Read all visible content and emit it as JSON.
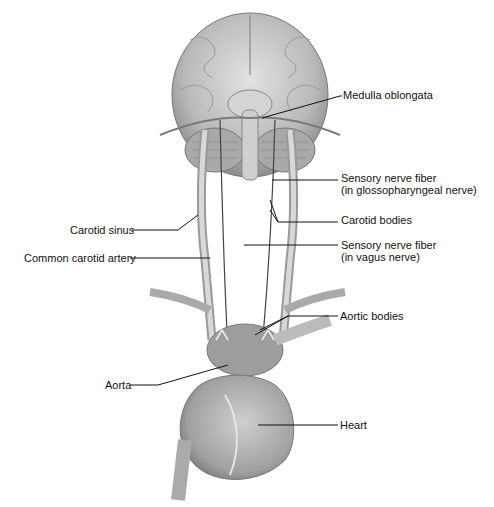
{
  "figure": {
    "type": "anatomical-diagram",
    "labels": {
      "medulla": "Medulla oblongata",
      "glosso_line1": "Sensory nerve fiber",
      "glosso_line2": "(in glossopharyngeal nerve)",
      "carotid_bodies": "Carotid bodies",
      "vagus_line1": "Sensory nerve fiber",
      "vagus_line2": "(in vagus nerve)",
      "carotid_sinus": "Carotid sinus",
      "common_carotid": "Common carotid artery",
      "aortic_bodies": "Aortic bodies",
      "aorta": "Aorta",
      "heart": "Heart"
    },
    "colors": {
      "background": "#ffffff",
      "tissue_light": "#d9d9d9",
      "tissue_mid": "#a8a8a8",
      "tissue_dark": "#6e6e6e",
      "leader_line": "#111111"
    }
  }
}
